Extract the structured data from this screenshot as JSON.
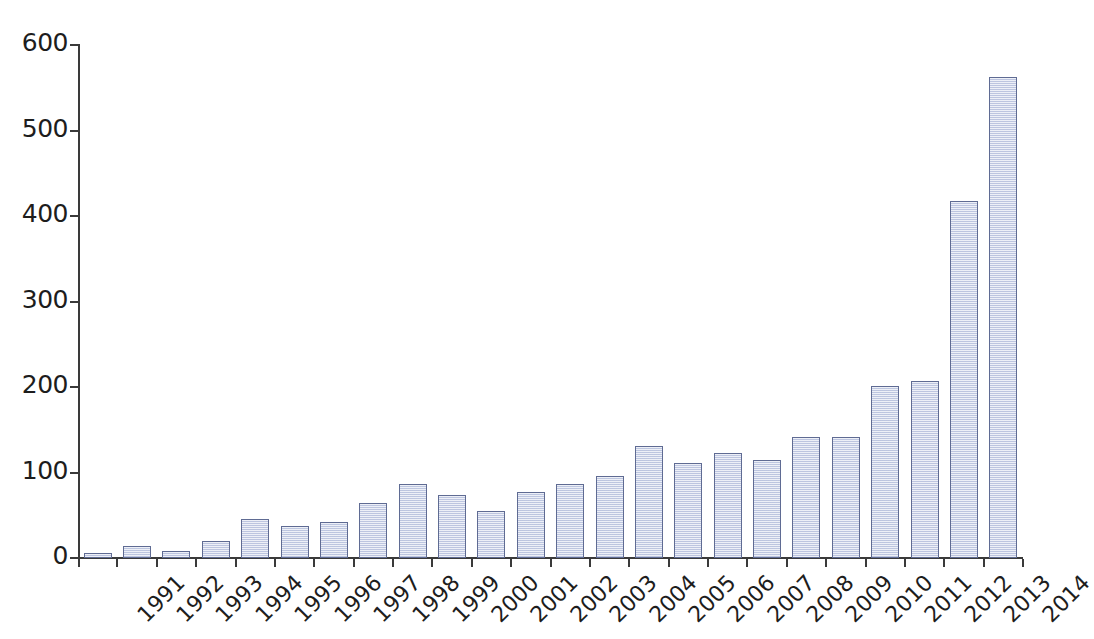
{
  "chart_data": {
    "type": "bar",
    "title": "",
    "subtitle": "",
    "xlabel": "",
    "ylabel": "",
    "categories": [
      "1991",
      "1992",
      "1993",
      "1994",
      "1995",
      "1996",
      "1997",
      "1998",
      "1999",
      "2000",
      "2001",
      "2002",
      "2003",
      "2004",
      "2005",
      "2006",
      "2007",
      "2008",
      "2009",
      "2010",
      "2011",
      "2012",
      "2013",
      "2014"
    ],
    "values": [
      6,
      14,
      8,
      20,
      46,
      37,
      42,
      64,
      86,
      74,
      55,
      77,
      87,
      96,
      131,
      111,
      123,
      115,
      142,
      142,
      201,
      207,
      418,
      562
    ],
    "ylim": [
      0,
      600
    ],
    "ytick_labels": [
      "0",
      "100",
      "200",
      "300",
      "400",
      "500",
      "600"
    ],
    "ytick_values": [
      0,
      100,
      200,
      300,
      400,
      500,
      600
    ],
    "grid": false,
    "legend": null,
    "series": [
      {
        "name": "count",
        "values": [
          6,
          14,
          8,
          20,
          46,
          37,
          42,
          64,
          86,
          74,
          55,
          77,
          87,
          96,
          131,
          111,
          123,
          115,
          142,
          142,
          201,
          207,
          418,
          562
        ]
      }
    ],
    "bar_fill_color": "#ccd3e9",
    "bar_border_color": "#5f6b93",
    "axis_color": "#3a3a3a",
    "text_color": "#1d1d1d",
    "xtick_label_rotation": "-45"
  }
}
